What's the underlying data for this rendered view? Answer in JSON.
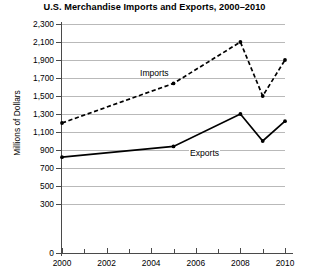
{
  "chart_data": {
    "type": "line",
    "title": "U.S. Merchandise Imports and Exports, 2000–2010",
    "xlabel": "",
    "ylabel": "Millions of Dollars",
    "x": [
      2000,
      2005,
      2008,
      2009,
      2010
    ],
    "xlim": [
      2000,
      2010
    ],
    "ylim": [
      0,
      2300
    ],
    "grid": true,
    "legend_position": "inline-labels",
    "x_tick_labels": [
      "2000",
      "2002",
      "2004",
      "2006",
      "2008",
      "2010"
    ],
    "x_tick_values": [
      2000,
      2002,
      2004,
      2006,
      2008,
      2010
    ],
    "x_minor_tick_values": [
      2001,
      2003,
      2005,
      2007,
      2009
    ],
    "y_tick_labels": [
      "2,300",
      "2,100",
      "1,900",
      "1,700",
      "1,500",
      "1,300",
      "1,100",
      "900",
      "700",
      "500",
      "300",
      "0"
    ],
    "y_tick_values": [
      2300,
      2100,
      1900,
      1700,
      1500,
      1300,
      1100,
      900,
      700,
      500,
      300,
      0
    ],
    "series": [
      {
        "name": "Imports",
        "style": "dashed",
        "values": [
          1200,
          1640,
          2100,
          1500,
          1900
        ],
        "points": [
          {
            "x": 2000,
            "y": 1200
          },
          {
            "x": 2005,
            "y": 1640
          },
          {
            "x": 2008,
            "y": 2100
          },
          {
            "x": 2009,
            "y": 1500
          },
          {
            "x": 2010,
            "y": 1900
          }
        ]
      },
      {
        "name": "Exports",
        "style": "solid",
        "values": [
          820,
          940,
          1300,
          1000,
          1220
        ],
        "points": [
          {
            "x": 2000,
            "y": 820
          },
          {
            "x": 2005,
            "y": 940
          },
          {
            "x": 2008,
            "y": 1300
          },
          {
            "x": 2009,
            "y": 1000
          },
          {
            "x": 2010,
            "y": 1220
          }
        ]
      }
    ],
    "annotations": [
      {
        "text": "Imports",
        "series": "Imports"
      },
      {
        "text": "Exports",
        "series": "Exports"
      }
    ]
  }
}
